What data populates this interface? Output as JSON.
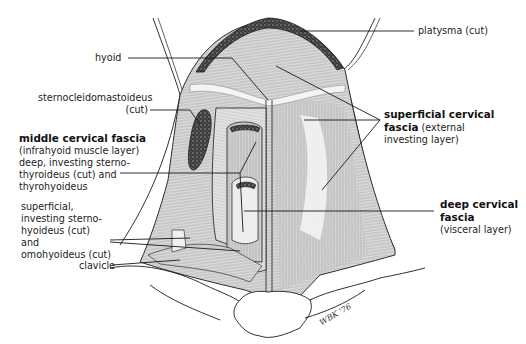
{
  "figure": {
    "colors": {
      "line": "#1a1a1a",
      "muscle_fill": "#d6d6d6",
      "muscle_light": "#ececec",
      "cut_muscle": "#3a3a3a",
      "background": "#ffffff"
    }
  },
  "labels": {
    "platysma": "platysma (cut)",
    "hyoid": "hyoid",
    "scm_line1": "sternocleidomastoideus",
    "scm_line2": "(cut)",
    "superficial_title1": "superficial cervical",
    "superficial_title2": "fascia",
    "superficial_sub1": "(external",
    "superficial_sub2": "investing layer)",
    "middle_title": "middle cervical fascia",
    "middle_sub1": "(infrahyoid muscle layer)",
    "middle_sub2": "deep, investing sterno-",
    "middle_sub3": "thyroideus (cut) and",
    "middle_sub4": "thyrohyoideus",
    "middle_sup1": "superficial,",
    "middle_sup2": "investing sterno-",
    "middle_sup3": "hyoideus (cut)",
    "middle_sup4": "and",
    "middle_sup5": "omohyoideus (cut)",
    "clavicle": "clavicle",
    "deep_title1": "deep cervical",
    "deep_title2": "fascia",
    "deep_sub": "(visceral layer)"
  },
  "signature": "WBK '76"
}
